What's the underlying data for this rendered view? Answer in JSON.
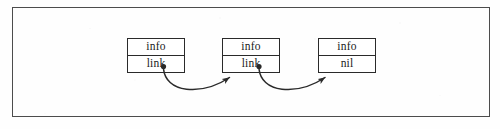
{
  "figure": {
    "type": "linked-list-diagram",
    "frame": {
      "border_color": "#4c4c4c"
    },
    "background_color": "#fefefe",
    "ink_color": "#2a2a2a"
  },
  "nodes": [
    {
      "id": "node-1",
      "top_cell": "info",
      "bottom_cell": "link",
      "has_pointer": true
    },
    {
      "id": "node-2",
      "top_cell": "info",
      "bottom_cell": "link",
      "has_pointer": true
    },
    {
      "id": "node-3",
      "top_cell": "info",
      "bottom_cell": "nil",
      "has_pointer": false
    }
  ],
  "arrows": [
    {
      "id": "arrow-1",
      "from": "node-1",
      "to": "node-2"
    },
    {
      "id": "arrow-2",
      "from": "node-2",
      "to": "node-3"
    }
  ]
}
